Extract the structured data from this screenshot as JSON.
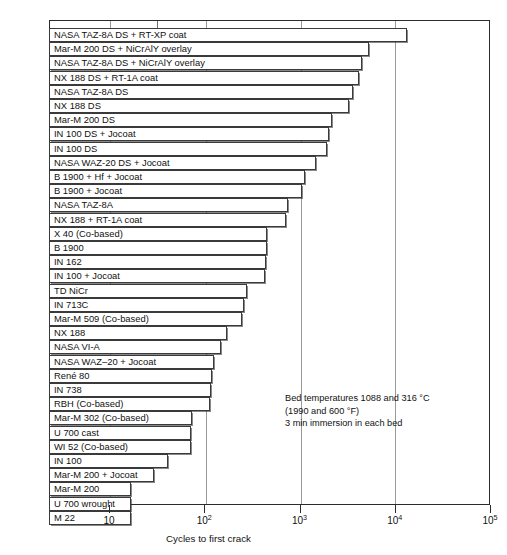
{
  "chart_data": {
    "type": "bar",
    "orientation": "horizontal",
    "title": "",
    "xlabel": "Cycles to first crack",
    "ylabel": "",
    "xscale": "log",
    "xlim": [
      4,
      100000
    ],
    "grid": true,
    "legend": null,
    "tick_labels": [
      "10",
      "10²",
      "10³",
      "10⁴",
      "10⁵"
    ],
    "tick_values": [
      10,
      100,
      1000,
      10000,
      100000
    ],
    "categories": [
      "NASA TAZ-8A DS + RT-XP coat",
      "Mar-M 200 DS + NiCrAlY overlay",
      "NASA TAZ-8A DS + NiCrAlY overlay",
      "NX 188 DS + RT-1A coat",
      "NASA TAZ-8A DS",
      "NX 188 DS",
      "Mar-M 200 DS",
      "IN 100 DS + Jocoat",
      "IN 100 DS",
      "NASA WAZ-20 DS + Jocoat",
      "B 1900 + Hf + Jocoat",
      "B 1900 + Jocoat",
      "NASA TAZ-8A",
      "NX 188 + RT-1A coat",
      "X 40 (Co-based)",
      "B 1900",
      "IN 162",
      "IN 100 + Jocoat",
      "TD NiCr",
      "IN 713C",
      "Mar-M 509 (Co-based)",
      "NX 188",
      "NASA VI-A",
      "NASA WAZ–20 + Jocoat",
      "René 80",
      "IN 738",
      "RBH (Co-based)",
      "Mar-M 302 (Co-based)",
      "U 700 cast",
      "WI 52 (Co-based)",
      "IN 100",
      "Mar-M 200 + Jocoat",
      "Mar-M 200",
      "U 700 wrought",
      "M 22"
    ],
    "values": [
      13500,
      5400,
      4500,
      4200,
      3600,
      3300,
      2200,
      2050,
      1950,
      1500,
      1150,
      1050,
      760,
      720,
      460,
      450,
      440,
      430,
      280,
      260,
      250,
      175,
      150,
      125,
      120,
      118,
      115,
      75,
      73,
      72,
      42,
      30,
      17,
      17,
      17
    ],
    "annotations": [
      "Bed temperatures 1088 and 316 °C",
      "(1990 and 600 °F)",
      "3 min immersion in each bed"
    ]
  },
  "axis": {
    "title": "Cycles to first crack",
    "ticks": [
      {
        "label_base": "10",
        "label_exp": "",
        "value": 10
      },
      {
        "label_base": "10",
        "label_exp": "2",
        "value": 100
      },
      {
        "label_base": "10",
        "label_exp": "3",
        "value": 1000
      },
      {
        "label_base": "10",
        "label_exp": "4",
        "value": 10000
      },
      {
        "label_base": "10",
        "label_exp": "5",
        "value": 100000
      }
    ]
  },
  "annotation": {
    "line1": "Bed temperatures 1088 and 316 °C",
    "line2": "(1990 and 600 °F)",
    "line3": "3 min immersion in each bed"
  },
  "colors": {
    "bar_fill": "#ffffff",
    "bar_stroke": "#3a3a3a",
    "grid": "#9a9a9a",
    "frame": "#2b2b2b",
    "text": "#111111"
  }
}
